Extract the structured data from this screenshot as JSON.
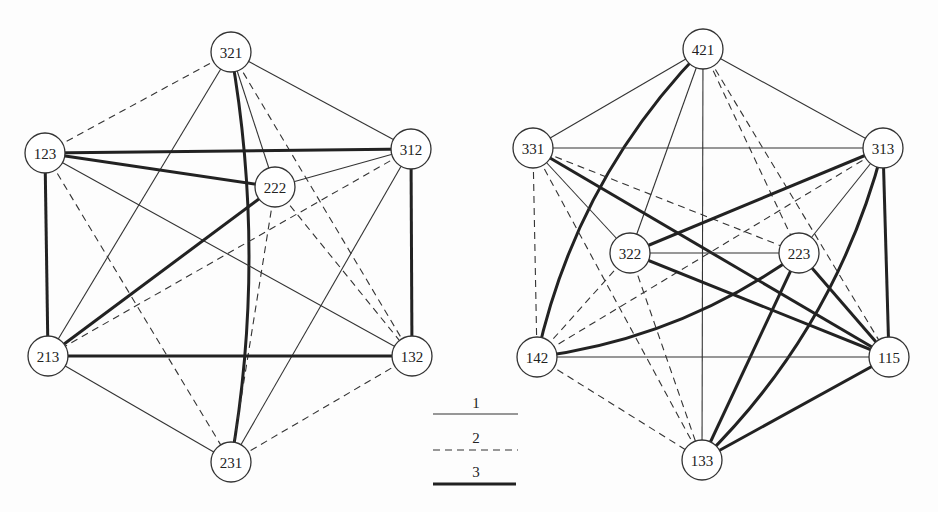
{
  "graphs": [
    {
      "name": "left-graph",
      "nodes": [
        {
          "id": "321",
          "x": 231,
          "y": 52
        },
        {
          "id": "123",
          "x": 45,
          "y": 153
        },
        {
          "id": "312",
          "x": 411,
          "y": 149
        },
        {
          "id": "222",
          "x": 275,
          "y": 187
        },
        {
          "id": "213",
          "x": 48,
          "y": 356
        },
        {
          "id": "132",
          "x": 412,
          "y": 356
        },
        {
          "id": "231",
          "x": 231,
          "y": 462
        }
      ],
      "edges": [
        {
          "from": "321",
          "to": "312",
          "type": 1
        },
        {
          "from": "321",
          "to": "123",
          "type": 2
        },
        {
          "from": "321",
          "to": "222",
          "type": 1
        },
        {
          "from": "321",
          "to": "213",
          "type": 1
        },
        {
          "from": "321",
          "to": "132",
          "type": 2
        },
        {
          "from": "321",
          "to": "231",
          "type": 3,
          "curve": -18
        },
        {
          "from": "123",
          "to": "312",
          "type": 3
        },
        {
          "from": "123",
          "to": "222",
          "type": 3
        },
        {
          "from": "123",
          "to": "213",
          "type": 3
        },
        {
          "from": "123",
          "to": "132",
          "type": 1
        },
        {
          "from": "123",
          "to": "231",
          "type": 2
        },
        {
          "from": "312",
          "to": "222",
          "type": 1
        },
        {
          "from": "312",
          "to": "132",
          "type": 3
        },
        {
          "from": "312",
          "to": "213",
          "type": 2
        },
        {
          "from": "312",
          "to": "231",
          "type": 1
        },
        {
          "from": "222",
          "to": "213",
          "type": 3
        },
        {
          "from": "222",
          "to": "231",
          "type": 2
        },
        {
          "from": "222",
          "to": "132",
          "type": 2
        },
        {
          "from": "213",
          "to": "132",
          "type": 3
        },
        {
          "from": "213",
          "to": "231",
          "type": 1
        },
        {
          "from": "132",
          "to": "231",
          "type": 2
        }
      ]
    },
    {
      "name": "right-graph",
      "nodes": [
        {
          "id": "421",
          "x": 703,
          "y": 49
        },
        {
          "id": "331",
          "x": 533,
          "y": 148
        },
        {
          "id": "313",
          "x": 883,
          "y": 148
        },
        {
          "id": "322",
          "x": 630,
          "y": 253
        },
        {
          "id": "223",
          "x": 799,
          "y": 253
        },
        {
          "id": "142",
          "x": 537,
          "y": 357
        },
        {
          "id": "115",
          "x": 889,
          "y": 357
        },
        {
          "id": "133",
          "x": 702,
          "y": 460
        }
      ],
      "edges": [
        {
          "from": "421",
          "to": "331",
          "type": 1
        },
        {
          "from": "421",
          "to": "313",
          "type": 1
        },
        {
          "from": "421",
          "to": "142",
          "type": 3,
          "curve": 25
        },
        {
          "from": "421",
          "to": "322",
          "type": 1
        },
        {
          "from": "421",
          "to": "133",
          "type": 1
        },
        {
          "from": "421",
          "to": "223",
          "type": 2
        },
        {
          "from": "421",
          "to": "115",
          "type": 2
        },
        {
          "from": "331",
          "to": "313",
          "type": 1
        },
        {
          "from": "331",
          "to": "223",
          "type": 2
        },
        {
          "from": "331",
          "to": "115",
          "type": 3
        },
        {
          "from": "331",
          "to": "322",
          "type": 1
        },
        {
          "from": "331",
          "to": "142",
          "type": 2
        },
        {
          "from": "331",
          "to": "133",
          "type": 2
        },
        {
          "from": "313",
          "to": "322",
          "type": 3
        },
        {
          "from": "313",
          "to": "142",
          "type": 2
        },
        {
          "from": "313",
          "to": "223",
          "type": 1
        },
        {
          "from": "313",
          "to": "115",
          "type": 3
        },
        {
          "from": "313",
          "to": "133",
          "type": 3,
          "curve": -25
        },
        {
          "from": "322",
          "to": "223",
          "type": 1
        },
        {
          "from": "322",
          "to": "115",
          "type": 3
        },
        {
          "from": "322",
          "to": "142",
          "type": 2
        },
        {
          "from": "322",
          "to": "133",
          "type": 2
        },
        {
          "from": "223",
          "to": "142",
          "type": 3,
          "curve": -18
        },
        {
          "from": "223",
          "to": "115",
          "type": 3
        },
        {
          "from": "223",
          "to": "133",
          "type": 3
        },
        {
          "from": "142",
          "to": "115",
          "type": 1
        },
        {
          "from": "142",
          "to": "133",
          "type": 2
        },
        {
          "from": "115",
          "to": "133",
          "type": 3
        }
      ]
    }
  ],
  "legend": {
    "items": [
      {
        "label": "1",
        "style": "solid-thin"
      },
      {
        "label": "2",
        "style": "dashed"
      },
      {
        "label": "3",
        "style": "solid-thick"
      }
    ]
  }
}
